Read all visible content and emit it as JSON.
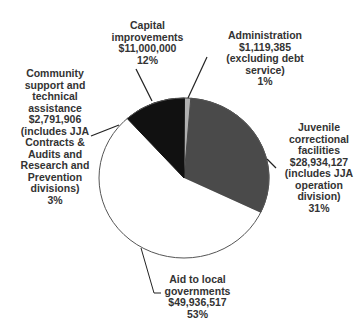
{
  "chart_data": {
    "type": "pie",
    "title": "",
    "slices": [
      {
        "label": "Juvenile correctional facilities",
        "value": 28934127,
        "percent": 31,
        "note": "(includes JJA operation division)",
        "color": "#4a4a4a"
      },
      {
        "label": "Aid to local governments",
        "value": 49936517,
        "percent": 53,
        "note": "",
        "color": "#ffffff"
      },
      {
        "label": "Community support and technical assistance",
        "value": 2791906,
        "percent": 3,
        "note": "(includes JJA Contracts & Audits and Research and Prevention divisions)",
        "color": "#ffffff"
      },
      {
        "label": "Capital improvements",
        "value": 11000000,
        "percent": 12,
        "note": "",
        "color": "#111111"
      },
      {
        "label": "Administration",
        "value": 1119385,
        "percent": 1,
        "note": "(excluding debt service)",
        "color": "#b0b0b0"
      }
    ],
    "legend": "none (callout labels)"
  },
  "labels": {
    "capital": [
      "Capital",
      "improvements",
      "$11,000,000",
      "12%"
    ],
    "admin": [
      "Administration",
      "$1,119,385",
      "(excluding debt",
      "service)",
      "1%"
    ],
    "community": [
      "Community",
      "support and",
      "technical",
      "assistance",
      "$2,791,906",
      "(includes JJA",
      "Contracts &",
      "Audits and",
      "Research and",
      "Prevention",
      "divisions)",
      "3%"
    ],
    "juvenile": [
      "Juvenile",
      "correctional",
      "facilities",
      "$28,934,127",
      "(includes JJA",
      "operation",
      "division)",
      "31%"
    ],
    "aid": [
      "Aid to local",
      "governments",
      "$49,936,517",
      "53%"
    ]
  }
}
